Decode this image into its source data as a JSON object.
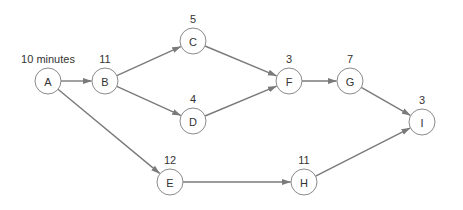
{
  "diagram": {
    "type": "activity-network",
    "node_radius": 13,
    "colors": {
      "edge": "#7a7a7a",
      "node_stroke": "#8a8a8a",
      "text": "#333333"
    },
    "nodes": [
      {
        "id": "A",
        "label": "A",
        "duration": "10 minutes",
        "x": 48,
        "y": 81
      },
      {
        "id": "B",
        "label": "B",
        "duration": "11",
        "x": 105,
        "y": 81
      },
      {
        "id": "C",
        "label": "C",
        "duration": "5",
        "x": 193,
        "y": 41
      },
      {
        "id": "D",
        "label": "D",
        "duration": "4",
        "x": 193,
        "y": 121
      },
      {
        "id": "E",
        "label": "E",
        "duration": "12",
        "x": 170,
        "y": 182
      },
      {
        "id": "F",
        "label": "F",
        "duration": "3",
        "x": 289,
        "y": 81
      },
      {
        "id": "G",
        "label": "G",
        "duration": "7",
        "x": 350,
        "y": 81
      },
      {
        "id": "H",
        "label": "H",
        "duration": "11",
        "x": 304,
        "y": 182
      },
      {
        "id": "I",
        "label": "I",
        "duration": "3",
        "x": 422,
        "y": 122
      }
    ],
    "edges": [
      {
        "from": "A",
        "to": "B"
      },
      {
        "from": "A",
        "to": "E"
      },
      {
        "from": "B",
        "to": "C"
      },
      {
        "from": "B",
        "to": "D"
      },
      {
        "from": "C",
        "to": "F"
      },
      {
        "from": "D",
        "to": "F"
      },
      {
        "from": "F",
        "to": "G"
      },
      {
        "from": "G",
        "to": "I"
      },
      {
        "from": "E",
        "to": "H"
      },
      {
        "from": "H",
        "to": "I"
      }
    ]
  }
}
